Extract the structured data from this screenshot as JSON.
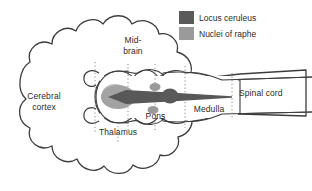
{
  "colors": {
    "outline": "#3d3d3d",
    "dotted_divider": "#8a8a8a",
    "locus_ceruleus": "#5a5a5a",
    "nuclei_of_raphe": "#9a9a9a",
    "text": "#2b2b2b",
    "background": "#ffffff"
  },
  "legend": {
    "items": [
      {
        "label": "Locus ceruleus",
        "color": "#5a5a5a",
        "swatch_name": "locus-ceruleus-swatch"
      },
      {
        "label": "Nuclei of raphe",
        "color": "#9a9a9a",
        "swatch_name": "nuclei-of-raphe-swatch"
      }
    ]
  },
  "labels": {
    "cerebral_cortex_line1": "Cerebral",
    "cerebral_cortex_line2": "cortex",
    "midbrain_line1": "Mid-",
    "midbrain_line2": "brain",
    "thalamus": "Thalamus",
    "pons": "Pons",
    "medulla": "Medulla",
    "spinal_cord": "Spinal cord"
  },
  "structures": [
    {
      "name": "cerebral-cortex",
      "shape": "lobed-cloud"
    },
    {
      "name": "thalamus-region",
      "shape": "oval"
    },
    {
      "name": "midbrain-region",
      "shape": "oval"
    },
    {
      "name": "pons-region",
      "shape": "oval"
    },
    {
      "name": "medulla-region",
      "shape": "taper"
    },
    {
      "name": "spinal-cord-region",
      "shape": "tube"
    }
  ],
  "nuclei_markers": [
    {
      "name": "raphe-thalamic-projection-blob",
      "tint": "nuclei_of_raphe",
      "cx": 118,
      "cy": 97,
      "rx": 17,
      "ry": 12
    },
    {
      "name": "raphe-dorsal-pontine-blob",
      "tint": "nuclei_of_raphe",
      "cx": 155,
      "cy": 87,
      "rx": 5.5,
      "ry": 4
    },
    {
      "name": "raphe-ventral-pontine-blob",
      "tint": "nuclei_of_raphe",
      "cx": 153,
      "cy": 110,
      "rx": 5.5,
      "ry": 4
    },
    {
      "name": "locus-ceruleus-blob",
      "tint": "locus_ceruleus",
      "cx": 170,
      "cy": 96,
      "rx": 8.5,
      "ry": 7.5
    }
  ],
  "projection_arrow": {
    "name": "ascending-projection-arrow",
    "direction": "leftward",
    "tip_x": 108,
    "tail_x": 232,
    "y": 97
  }
}
